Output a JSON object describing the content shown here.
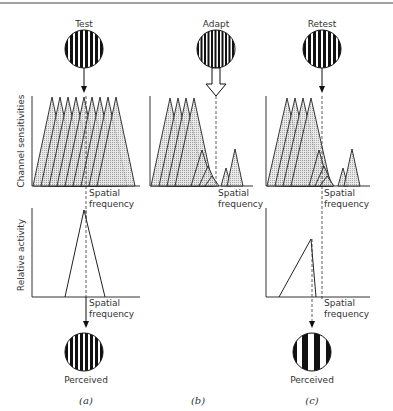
{
  "figure": {
    "panels": [
      {
        "id": "a",
        "caption": "(a)",
        "stimulus_label": "Test",
        "perceived_label": "Perceived"
      },
      {
        "id": "b",
        "caption": "(b)",
        "stimulus_label": "Adapt"
      },
      {
        "id": "c",
        "caption": "(c)",
        "stimulus_label": "Retest",
        "perceived_label": "Perceived"
      }
    ],
    "axes": {
      "top_ylabel": "Channel sensitivities",
      "bottom_ylabel": "Relative activity",
      "xlabel_line1": "Spatial",
      "xlabel_line2": "frequency"
    }
  }
}
